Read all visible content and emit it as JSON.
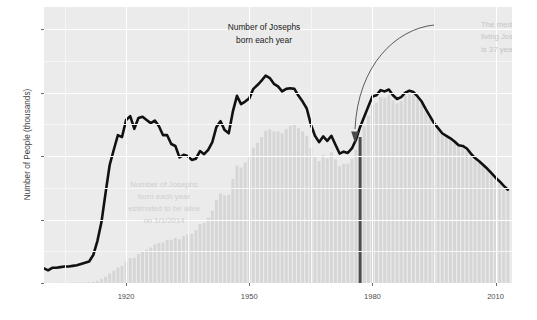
{
  "chart_data": {
    "type": "line",
    "title": "",
    "xlabel": "",
    "ylabel": "Number of People (thousands)",
    "xlim": [
      1900,
      2014
    ],
    "ylim": [
      0,
      43.5
    ],
    "grid": true,
    "legend_position": "none",
    "x_ticks": [
      "1920",
      "1950",
      "1980",
      "2010"
    ],
    "x_tick_values": [
      1920,
      1950,
      1980,
      2010
    ],
    "y_ticks": [
      "0",
      "10",
      "20",
      "30",
      "40"
    ],
    "y_tick_values": [
      0,
      10,
      20,
      30,
      40
    ],
    "annotations": [
      {
        "name": "births-label",
        "text_line_1": "Number of Josephs",
        "text_line_2": "born each year",
        "color": "#1a1a1a"
      },
      {
        "name": "alive-label",
        "text_line_1": "Number of Josephs",
        "text_line_2": "born each year",
        "text_line_3": "estimated to be alive",
        "text_line_4": "on 1/1/2014",
        "color": "#cfcfcf"
      },
      {
        "name": "median-label",
        "text_line_1": "The median",
        "text_line_2": "living Joseph",
        "text_line_3": "is 37 years old",
        "color": "#c4c4c4",
        "median_age": 37,
        "median_birth_year": 1977
      }
    ],
    "series": [
      {
        "name": "Josephs born each year",
        "type": "line",
        "color": "#111111",
        "x": [
          1900,
          1901,
          1902,
          1903,
          1904,
          1905,
          1906,
          1907,
          1908,
          1909,
          1910,
          1911,
          1912,
          1913,
          1914,
          1915,
          1916,
          1917,
          1918,
          1919,
          1920,
          1921,
          1922,
          1923,
          1924,
          1925,
          1926,
          1927,
          1928,
          1929,
          1930,
          1931,
          1932,
          1933,
          1934,
          1935,
          1936,
          1937,
          1938,
          1939,
          1940,
          1941,
          1942,
          1943,
          1944,
          1945,
          1946,
          1947,
          1948,
          1949,
          1950,
          1951,
          1952,
          1953,
          1954,
          1955,
          1956,
          1957,
          1958,
          1959,
          1960,
          1961,
          1962,
          1963,
          1964,
          1965,
          1966,
          1967,
          1968,
          1969,
          1970,
          1971,
          1972,
          1973,
          1974,
          1975,
          1976,
          1977,
          1978,
          1979,
          1980,
          1981,
          1982,
          1983,
          1984,
          1985,
          1986,
          1987,
          1988,
          1989,
          1990,
          1991,
          1992,
          1993,
          1994,
          1995,
          1996,
          1997,
          1998,
          1999,
          2000,
          2001,
          2002,
          2003,
          2004,
          2005,
          2006,
          2007,
          2008,
          2009,
          2010,
          2011,
          2012,
          2013
        ],
        "values": [
          2.3,
          2.0,
          2.4,
          2.4,
          2.5,
          2.6,
          2.6,
          2.7,
          2.8,
          3.0,
          3.2,
          3.4,
          4.4,
          6.6,
          9.6,
          14.2,
          18.6,
          21.0,
          23.3,
          23.0,
          25.7,
          26.3,
          24.3,
          26.0,
          26.2,
          25.7,
          25.2,
          25.6,
          24.7,
          23.3,
          23.3,
          21.9,
          21.6,
          19.8,
          20.2,
          20.0,
          19.4,
          19.6,
          20.8,
          20.3,
          21.0,
          22.2,
          24.6,
          25.5,
          24.1,
          23.6,
          27.0,
          29.5,
          28.2,
          28.6,
          29.1,
          30.6,
          31.2,
          31.9,
          32.7,
          32.3,
          31.4,
          31.0,
          30.2,
          30.6,
          30.7,
          30.6,
          29.5,
          28.6,
          27.5,
          25.0,
          23.2,
          22.2,
          23.1,
          22.4,
          23.2,
          21.8,
          20.4,
          20.7,
          20.5,
          21.2,
          22.6,
          24.6,
          26.2,
          27.8,
          29.4,
          29.6,
          30.4,
          30.2,
          30.5,
          29.6,
          29.0,
          29.3,
          30.0,
          30.3,
          30.1,
          29.4,
          28.6,
          27.4,
          26.3,
          25.2,
          24.4,
          23.6,
          23.2,
          22.8,
          22.3,
          21.7,
          21.6,
          21.2,
          20.4,
          19.7,
          19.2,
          18.6,
          18.0,
          17.3,
          16.6,
          16.0,
          15.3,
          14.7
        ]
      },
      {
        "name": "Josephs born each year estimated to be alive on 1/1/2014",
        "type": "bar",
        "color": "#d6d6d6",
        "x": [
          1900,
          1901,
          1902,
          1903,
          1904,
          1905,
          1906,
          1907,
          1908,
          1909,
          1910,
          1911,
          1912,
          1913,
          1914,
          1915,
          1916,
          1917,
          1918,
          1919,
          1920,
          1921,
          1922,
          1923,
          1924,
          1925,
          1926,
          1927,
          1928,
          1929,
          1930,
          1931,
          1932,
          1933,
          1934,
          1935,
          1936,
          1937,
          1938,
          1939,
          1940,
          1941,
          1942,
          1943,
          1944,
          1945,
          1946,
          1947,
          1948,
          1949,
          1950,
          1951,
          1952,
          1953,
          1954,
          1955,
          1956,
          1957,
          1958,
          1959,
          1960,
          1961,
          1962,
          1963,
          1964,
          1965,
          1966,
          1967,
          1968,
          1969,
          1970,
          1971,
          1972,
          1973,
          1974,
          1975,
          1976,
          1977,
          1978,
          1979,
          1980,
          1981,
          1982,
          1983,
          1984,
          1985,
          1986,
          1987,
          1988,
          1989,
          1990,
          1991,
          1992,
          1993,
          1994,
          1995,
          1996,
          1997,
          1998,
          1999,
          2000,
          2001,
          2002,
          2003,
          2004,
          2005,
          2006,
          2007,
          2008,
          2009,
          2010,
          2011,
          2012,
          2013
        ],
        "values": [
          0.01,
          0.01,
          0.02,
          0.02,
          0.03,
          0.03,
          0.04,
          0.05,
          0.06,
          0.08,
          0.1,
          0.13,
          0.2,
          0.35,
          0.6,
          1.0,
          1.5,
          1.95,
          2.45,
          2.7,
          3.4,
          3.9,
          3.95,
          4.6,
          5.0,
          5.3,
          5.6,
          6.1,
          6.3,
          6.4,
          6.8,
          6.8,
          7.1,
          6.9,
          7.4,
          7.7,
          7.8,
          8.3,
          9.3,
          9.5,
          10.3,
          11.4,
          13.1,
          14.1,
          13.8,
          13.9,
          16.4,
          18.5,
          18.2,
          19.0,
          19.8,
          21.3,
          22.1,
          23.0,
          24.0,
          24.2,
          23.9,
          23.9,
          23.6,
          24.3,
          24.8,
          25.0,
          24.4,
          23.9,
          23.2,
          21.3,
          19.9,
          19.2,
          20.2,
          19.7,
          20.6,
          19.5,
          18.4,
          18.8,
          18.8,
          19.6,
          21.0,
          23.0,
          24.7,
          26.4,
          28.1,
          28.4,
          29.3,
          29.2,
          29.6,
          28.8,
          28.3,
          28.7,
          29.5,
          29.8,
          29.7,
          29.1,
          28.3,
          27.2,
          26.1,
          25.1,
          24.3,
          23.5,
          23.1,
          22.7,
          22.2,
          21.6,
          21.5,
          21.1,
          20.3,
          19.6,
          19.1,
          18.5,
          17.9,
          17.2,
          16.5,
          15.9,
          15.2,
          14.6
        ]
      },
      {
        "name": "median marker",
        "type": "vline",
        "color": "#4d4d4d",
        "x": 1977,
        "value": 23.0
      }
    ]
  },
  "axes": {
    "y_title": "Number of People (thousands)"
  },
  "colors": {
    "panel_background": "#ebebeb",
    "grid_major": "#ffffff",
    "grid_minor": "#f6f6f6",
    "line": "#111111",
    "bar": "#d6d6d6",
    "median_marker": "#4d4d4d",
    "tick_label": "#4c4c4c",
    "axis_title": "#3f3f3f",
    "annotation_dark": "#1a1a1a",
    "annotation_faint": "#cfcfcf"
  }
}
